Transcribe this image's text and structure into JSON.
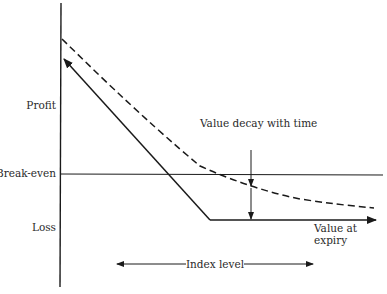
{
  "diagram": {
    "type": "option-payoff",
    "y_axis_labels": {
      "profit": "Profit",
      "break_even": "Break-even",
      "loss": "Loss"
    },
    "annotations": {
      "value_decay": "Value decay with time",
      "value_at_expiry_line1": "Value at",
      "value_at_expiry_line2": "expiry",
      "index_level": "Index level"
    },
    "series": [
      {
        "name": "Value at expiry",
        "style": "solid",
        "points": [
          [
            62,
            57
          ],
          [
            210,
            220
          ],
          [
            375,
            220
          ]
        ]
      },
      {
        "name": "Value before expiry",
        "style": "dashed",
        "points": [
          [
            62,
            39
          ],
          [
            100,
            76
          ],
          [
            190,
            160
          ],
          [
            251,
            187
          ],
          [
            374,
            208
          ]
        ]
      }
    ],
    "colors": {
      "line": "#1a1a1a",
      "text": "#2a2a2a",
      "background": "#ffffff"
    }
  }
}
